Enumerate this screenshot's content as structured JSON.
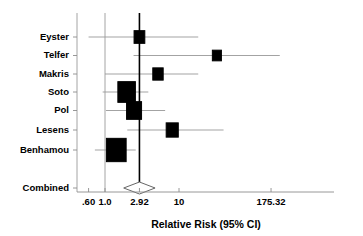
{
  "chart_data": {
    "type": "forest",
    "title": "",
    "xlabel": "Relative Risk (95% CI)",
    "ylabel": "",
    "scale": "log10",
    "xlim": [
      0.6,
      175.32
    ],
    "grid": false,
    "legend": "none",
    "null_reference_value": 2.92,
    "tick_values": [
      0.6,
      1.0,
      2.92,
      10,
      175.32
    ],
    "tick_labels": [
      ".60",
      "1.0",
      "2.92",
      "10",
      "175.32"
    ],
    "categories": [
      "Eyster",
      "Telfer",
      "Makris",
      "Soto",
      "Pol",
      "Lesens",
      "Benhamou",
      "Combined"
    ],
    "studies": [
      {
        "label": "Eyster",
        "estimate": 2.92,
        "ci_low": 0.6,
        "ci_high": 18.2,
        "weight": 0.22
      },
      {
        "label": "Telfer",
        "estimate": 32.5,
        "ci_low": 2.43,
        "ci_high": 230.0,
        "weight": 0.12
      },
      {
        "label": "Makris",
        "estimate": 5.2,
        "ci_low": 1.0,
        "ci_high": 18.2,
        "weight": 0.2
      },
      {
        "label": "Soto",
        "estimate": 1.96,
        "ci_low": 0.93,
        "ci_high": 3.85,
        "weight": 0.62
      },
      {
        "label": "Pol",
        "estimate": 2.47,
        "ci_low": 1.03,
        "ci_high": 6.5,
        "weight": 0.47
      },
      {
        "label": "Lesens",
        "estimate": 8.1,
        "ci_low": 2.0,
        "ci_high": 40.0,
        "weight": 0.3
      },
      {
        "label": "Benhamou",
        "estimate": 1.42,
        "ci_low": 0.73,
        "ci_high": 2.6,
        "weight": 0.75
      }
    ],
    "summary": {
      "label": "Combined",
      "estimate": 2.92,
      "ci_low": 1.79,
      "ci_high": 4.75
    }
  },
  "axis": {
    "title": "Relative Risk (95% CI)",
    "ticks": [
      {
        "value": 0.6,
        "label": ".60"
      },
      {
        "value": 1.0,
        "label": "1.0"
      },
      {
        "value": 2.92,
        "label": "2.92"
      },
      {
        "value": 10,
        "label": "10"
      },
      {
        "value": 175.32,
        "label": "175.32"
      }
    ]
  },
  "labels": {
    "eyster": "Eyster",
    "telfer": "Telfer",
    "makris": "Makris",
    "soto": "Soto",
    "pol": "Pol",
    "lesens": "Lesens",
    "benhamou": "Benhamou",
    "combined": "Combined"
  },
  "colors": {
    "marker": "#000000",
    "ci": "#999999",
    "null_line": "#000000",
    "axis": "#8c8c8c",
    "background": "#ffffff",
    "text": "#000000"
  }
}
